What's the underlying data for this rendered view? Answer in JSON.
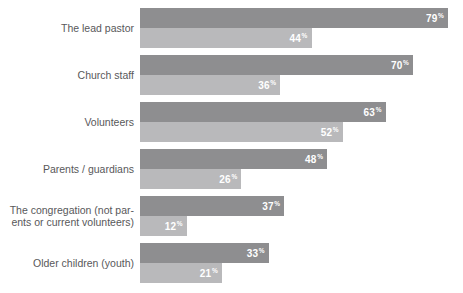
{
  "chart_data": {
    "type": "bar",
    "title": "",
    "xlabel": "",
    "ylabel": "",
    "orientation": "horizontal",
    "grid": false,
    "legend": "none",
    "xlim": [
      0,
      79
    ],
    "value_suffix": "%",
    "categories": [
      "The lead pastor",
      "Church staff",
      "Volunteers",
      "Parents / guardians",
      "The congregation (not par-\nents or current volunteers)",
      "Older children (youth)"
    ],
    "series": [
      {
        "name": "primary",
        "color": "#8e8e90",
        "values": [
          79,
          70,
          63,
          48,
          37,
          33
        ]
      },
      {
        "name": "secondary",
        "color": "#b9b9bb",
        "values": [
          44,
          36,
          52,
          26,
          12,
          21
        ]
      }
    ],
    "rows": [
      {
        "label": "The lead pastor",
        "primary_value": 79,
        "primary_label": "79",
        "secondary_value": 44,
        "secondary_label": "44"
      },
      {
        "label": "Church staff",
        "primary_value": 70,
        "primary_label": "70",
        "secondary_value": 36,
        "secondary_label": "36"
      },
      {
        "label": "Volunteers",
        "primary_value": 63,
        "primary_label": "63",
        "secondary_value": 52,
        "secondary_label": "52"
      },
      {
        "label": "Parents / guardians",
        "primary_value": 48,
        "primary_label": "48",
        "secondary_value": 26,
        "secondary_label": "26"
      },
      {
        "label": "The congregation (not par-\nents or current volunteers)",
        "primary_value": 37,
        "primary_label": "37",
        "secondary_value": 12,
        "secondary_label": "12"
      },
      {
        "label": "Older children (youth)",
        "primary_value": 33,
        "primary_label": "33",
        "secondary_value": 21,
        "secondary_label": "21"
      }
    ]
  },
  "style": {
    "background": "#ffffff",
    "primary_color": "#8e8e90",
    "secondary_color": "#b9b9bb",
    "label_color": "#58585a",
    "value_color": "#ffffff"
  },
  "percent_symbol": "%"
}
